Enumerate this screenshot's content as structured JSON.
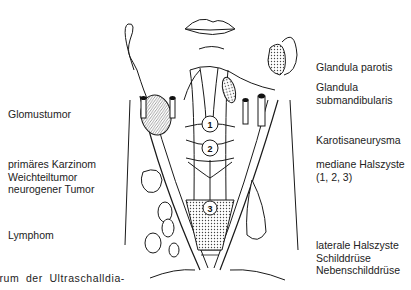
{
  "figure": {
    "type": "anatomical-diagram",
    "left_labels": [
      {
        "id": "glomustumor",
        "lines": [
          "Glomustumor"
        ]
      },
      {
        "id": "tumors",
        "lines": [
          "primäres Karzinom",
          "Weichteiltumor",
          "neurogener Tumor"
        ]
      },
      {
        "id": "lymphom",
        "lines": [
          "Lymphom"
        ]
      }
    ],
    "right_labels": [
      {
        "id": "parotis",
        "lines": [
          "Glandula parotis"
        ]
      },
      {
        "id": "submandibularis",
        "lines": [
          "Glandula",
          "submandibularis"
        ]
      },
      {
        "id": "karotis",
        "lines": [
          "Karotisaneurysma"
        ]
      },
      {
        "id": "halszyste-median",
        "lines": [
          "mediane Halszyste",
          "(1, 2, 3)"
        ]
      },
      {
        "id": "lower-right",
        "lines": [
          "laterale Halszyste",
          "Schilddrüse",
          "Nebenschilddrüse"
        ]
      }
    ],
    "markers": [
      "1",
      "2",
      "3"
    ],
    "caption_fragment": "trum der Ultraschalldia-"
  }
}
